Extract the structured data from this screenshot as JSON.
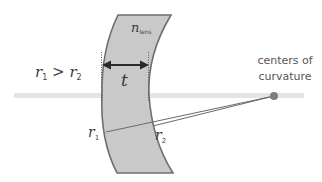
{
  "diagram": {
    "type": "concave-meniscus-lens",
    "colors": {
      "lens_fill": "#c8c8c8",
      "lens_stroke": "#6a6a6a",
      "axis": "#e2e2e2",
      "ray": "#6a6a6a",
      "center_dot": "#7a7a7a",
      "text": "#555555"
    },
    "labels": {
      "condition": {
        "r": "r",
        "sub1": "1",
        "gt": " > ",
        "sub2": "2"
      },
      "thickness": "t",
      "refractive_index": {
        "n": "n",
        "sub": "lens"
      },
      "radius1": {
        "r": "r",
        "sub": "1"
      },
      "radius2": {
        "r": "r",
        "sub": "2"
      },
      "centers_line1": "centers of",
      "centers_line2": "curvature"
    }
  }
}
